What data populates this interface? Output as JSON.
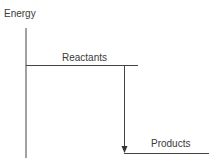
{
  "diagram": {
    "axis_label": "Energy",
    "levels": [
      {
        "name": "reactants",
        "label": "Reactants"
      },
      {
        "name": "products",
        "label": "Products"
      }
    ],
    "arrow": {
      "from": "reactants",
      "to": "products",
      "direction": "down"
    }
  }
}
